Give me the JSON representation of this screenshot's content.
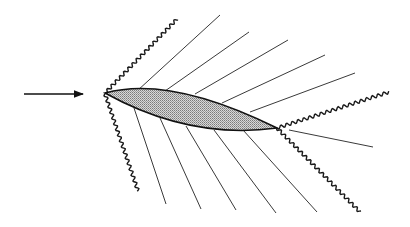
{
  "diagram": {
    "title": "",
    "colors": {
      "background": "#ffffff",
      "line": "#111111",
      "airfoil_fill": "#b4b4b4"
    },
    "freestream_arrow": {
      "from": [
        24,
        94
      ],
      "to": [
        83,
        94
      ]
    },
    "airfoil": {
      "leading_edge": [
        105,
        93
      ],
      "trailing_edge": [
        277,
        128
      ],
      "upper_surface_control": [
        170,
        75
      ],
      "lower_surface_control": [
        190,
        140
      ]
    },
    "shocks": [
      {
        "name": "leading-edge-upper-shock",
        "from": [
          105,
          93
        ],
        "to": [
          177,
          19
        ]
      },
      {
        "name": "leading-edge-lower-shock",
        "from": [
          105,
          94
        ],
        "to": [
          138,
          191
        ]
      },
      {
        "name": "trailing-edge-upper-shock",
        "from": [
          277,
          128
        ],
        "to": [
          389,
          92
        ]
      },
      {
        "name": "trailing-edge-lower-shock",
        "from": [
          277,
          128
        ],
        "to": [
          360,
          212
        ]
      }
    ],
    "upper_expansion_lines": [
      {
        "from": [
          137,
          91
        ],
        "to": [
          220,
          15
        ]
      },
      {
        "from": [
          165,
          91
        ],
        "to": [
          249,
          32
        ]
      },
      {
        "from": [
          195,
          94
        ],
        "to": [
          288,
          40
        ]
      },
      {
        "from": [
          222,
          103
        ],
        "to": [
          325,
          55
        ]
      },
      {
        "from": [
          250,
          112
        ],
        "to": [
          355,
          73
        ]
      }
    ],
    "lower_expansion_lines": [
      {
        "from": [
          134,
          108
        ],
        "to": [
          166,
          204
        ]
      },
      {
        "from": [
          160,
          118
        ],
        "to": [
          201,
          209
        ]
      },
      {
        "from": [
          186,
          126
        ],
        "to": [
          236,
          210
        ]
      },
      {
        "from": [
          214,
          130
        ],
        "to": [
          276,
          213
        ]
      },
      {
        "from": [
          243,
          130
        ],
        "to": [
          317,
          212
        ]
      }
    ],
    "wake_line": {
      "from": [
        289,
        130
      ],
      "to": [
        373,
        147
      ]
    }
  }
}
